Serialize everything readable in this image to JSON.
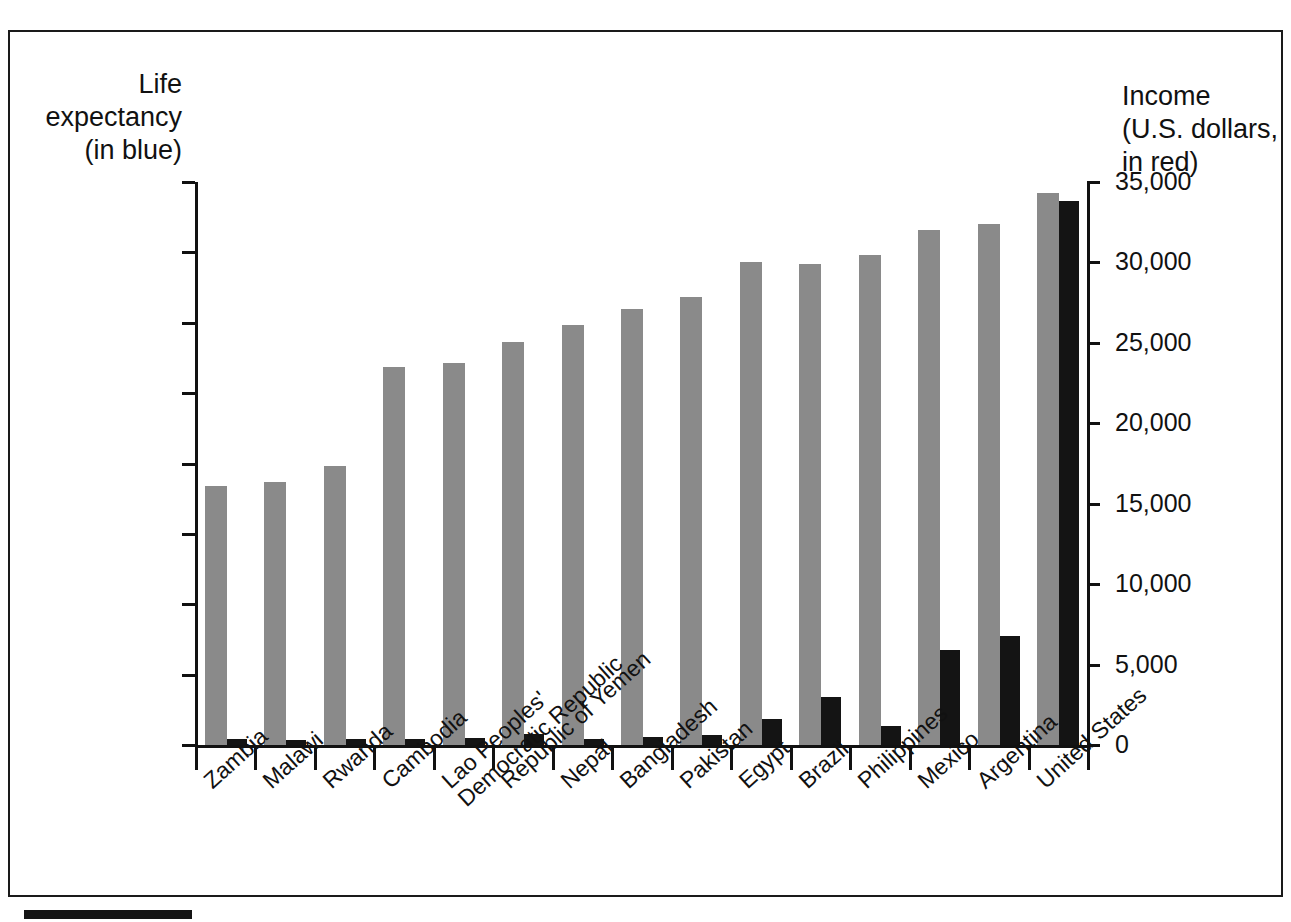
{
  "figure": {
    "left_axis_title": "Life\nexpectancy\n(in blue)",
    "right_axis_title": "Income\n(U.S. dollars,\nin red)"
  },
  "chart_data": {
    "type": "bar",
    "title": "",
    "xlabel": "",
    "ylabel": "Life expectancy (in blue)",
    "y2label": "Income (U.S. dollars, in red)",
    "ylim": [
      0,
      80
    ],
    "y2lim": [
      0,
      35000
    ],
    "yticks": [
      "0",
      "10",
      "20",
      "30",
      "40",
      "50",
      "60",
      "70",
      "80"
    ],
    "ytick_values": [
      0,
      10,
      20,
      30,
      40,
      50,
      60,
      70,
      80
    ],
    "y2ticks": [
      "0",
      "5,000",
      "10,000",
      "15,000",
      "20,000",
      "25,000",
      "30,000",
      "35,000"
    ],
    "y2tick_values": [
      0,
      5000,
      10000,
      15000,
      20000,
      25000,
      30000,
      35000
    ],
    "grid": false,
    "legend": "none",
    "categories": [
      "Zambia",
      "Malawi",
      "Rwanda",
      "Cambodia",
      "Lao Peoples'\nDemocratic Republic",
      "Republic of Yemen",
      "Nepal",
      "Bangladesh",
      "Pakistan",
      "Egypt",
      "Brazil",
      "Philippines",
      "Mexico",
      "Argentina",
      "United States"
    ],
    "series": [
      {
        "name": "Life expectancy",
        "axis": "left",
        "unit": "years",
        "color": "#8a8a8a",
        "values": [
          36.8,
          37.4,
          39.7,
          53.7,
          54.3,
          57.2,
          59.7,
          61.9,
          63.6,
          68.7,
          68.4,
          69.6,
          73.2,
          74.1,
          78.4
        ]
      },
      {
        "name": "Income",
        "axis": "right",
        "unit": "U.S. dollars",
        "color": "#141414",
        "values": [
          400,
          300,
          350,
          380,
          450,
          680,
          380,
          520,
          600,
          1630,
          2960,
          1190,
          5900,
          6760,
          33800
        ]
      }
    ]
  }
}
